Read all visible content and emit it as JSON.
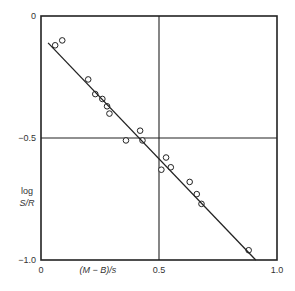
{
  "chart_data": {
    "type": "scatter",
    "title": "",
    "xlabel": "(M − B)/s",
    "ylabel": [
      "log",
      "S/R"
    ],
    "xlim": [
      0,
      1.0
    ],
    "ylim": [
      -1.0,
      0
    ],
    "x_ticks": [
      0,
      0.5,
      1.0
    ],
    "x_tick_labels": [
      "0",
      "0.5",
      "1.0"
    ],
    "y_ticks": [
      0,
      -0.5,
      -1.0
    ],
    "y_tick_labels": [
      "0",
      "−0.5",
      "−1.0"
    ],
    "grid": "reference lines at x=0.5 and y=-0.5",
    "legend": null,
    "series": [
      {
        "name": "observations",
        "marker": "open-circle",
        "x": [
          0.06,
          0.09,
          0.2,
          0.23,
          0.26,
          0.28,
          0.29,
          0.36,
          0.42,
          0.43,
          0.53,
          0.51,
          0.55,
          0.63,
          0.66,
          0.68,
          0.88
        ],
        "y": [
          -0.12,
          -0.1,
          -0.26,
          -0.32,
          -0.34,
          -0.37,
          -0.4,
          -0.51,
          -0.47,
          -0.51,
          -0.58,
          -0.63,
          -0.62,
          -0.68,
          -0.73,
          -0.77,
          -0.96
        ]
      },
      {
        "name": "fitted line",
        "type": "line",
        "x": [
          0.03,
          0.91
        ],
        "y": [
          -0.11,
          -1.0
        ]
      }
    ]
  }
}
